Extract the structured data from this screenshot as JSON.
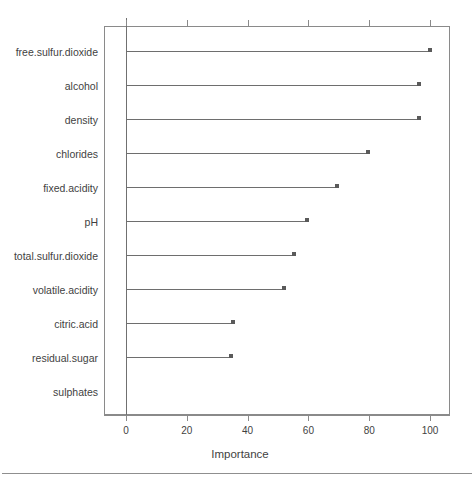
{
  "chart_data": {
    "type": "bar",
    "title": "",
    "subtitle": "",
    "xlabel": "Importance",
    "ylabel": "",
    "xlim": [
      0,
      100
    ],
    "xticks": [
      0,
      20,
      40,
      60,
      80,
      100
    ],
    "xtick_labels": [
      "0",
      "20",
      "40",
      "60",
      "80",
      "100"
    ],
    "grid": false,
    "legend": null,
    "orientation": "horizontal",
    "style": "lollipop-dotchart",
    "categories": [
      "free.sulfur.dioxide",
      "alcohol",
      "density",
      "chlorides",
      "fixed.acidity",
      "pH",
      "total.sulfur.dioxide",
      "volatile.acidity",
      "citric.acid",
      "residual.sugar",
      "sulphates"
    ],
    "values": [
      100,
      96.4,
      96.4,
      79.5,
      69.3,
      59.4,
      55.4,
      52.0,
      35.3,
      34.5,
      0
    ],
    "series": [
      {
        "name": "Importance",
        "values": [
          100,
          96.4,
          96.4,
          79.5,
          69.3,
          59.4,
          55.4,
          52.0,
          35.3,
          34.5,
          0
        ]
      }
    ]
  },
  "figure": {
    "axis_title": "Importance",
    "line_color": "#6e6e6e",
    "dot_color": "#5a5a5a",
    "box_color": "#8a8a8a",
    "text_color": "#3f3f3f",
    "background": "#ffffff"
  }
}
